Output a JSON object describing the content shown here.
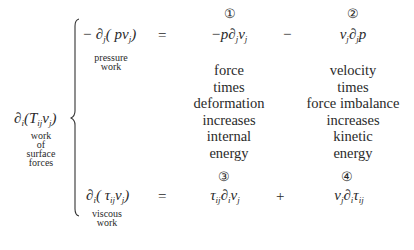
{
  "lhs": {
    "expression": "∂ᵢ(Tᵢⱼvⱼ)",
    "label_lines": [
      "work",
      "of",
      "surface",
      "forces"
    ]
  },
  "rows": [
    {
      "term": "−∂ⱼ(pvⱼ)",
      "term_label_lines": [
        "pressure",
        "work"
      ],
      "equals": "=",
      "terms": [
        {
          "number": "①",
          "expression": "−p∂ⱼvⱼ",
          "description_lines": [
            "force",
            "times",
            "deformation",
            "increases",
            "internal",
            "energy"
          ]
        },
        {
          "number": "②",
          "expression": "vⱼ∂ⱼp",
          "description_lines": [
            "velocity",
            "times",
            "force imbalance",
            "increases",
            "kinetic",
            "energy"
          ]
        }
      ],
      "operator": "−"
    },
    {
      "term": "∂ᵢ(τᵢⱼvⱼ)",
      "term_label_lines": [
        "viscous",
        "work"
      ],
      "equals": "=",
      "terms": [
        {
          "number": "③",
          "expression": "τᵢⱼ∂ᵢvⱼ"
        },
        {
          "number": "④",
          "expression": "vⱼ∂ᵢτᵢⱼ"
        }
      ],
      "operator": "+"
    }
  ]
}
